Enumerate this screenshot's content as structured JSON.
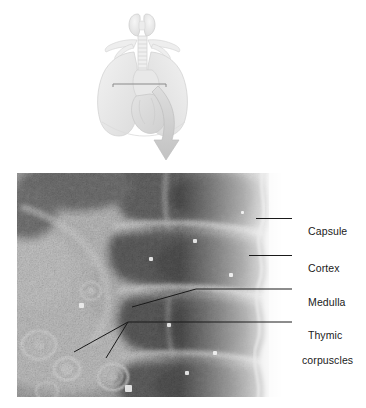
{
  "figure": {
    "illustration": {
      "name": "thorax-thymus-illustration",
      "description": "Anterior view of thorax showing thyroid gland, trachea, lungs and heart with a curved arrow pointing to the micrograph below",
      "structures": [
        "thyroid gland",
        "trachea",
        "right lung",
        "left lung",
        "heart",
        "clavicles"
      ],
      "indicator_line": "horizontal section indicator across the mediastinum",
      "arrow": "curved-down-arrow"
    },
    "micrograph": {
      "name": "thymus-light-micrograph",
      "description": "Light micrograph of thymus showing capsule, cortex, medulla and thymic corpuscles",
      "stain": "grayscale",
      "regions": [
        "capsule",
        "cortex",
        "medulla",
        "thymic corpuscles"
      ]
    },
    "labels": [
      {
        "id": "capsule",
        "text": "Capsule",
        "text2": ""
      },
      {
        "id": "cortex",
        "text": "Cortex",
        "text2": ""
      },
      {
        "id": "medulla",
        "text": "Medulla",
        "text2": ""
      },
      {
        "id": "thymic",
        "text": "Thymic",
        "text2": "corpuscles"
      }
    ],
    "colors": {
      "label_text": "#1a1a1a",
      "leader_line": "#1a1a1a",
      "background": "#ffffff",
      "micrograph_mid": "#8c8c8c",
      "micrograph_dark": "#4a4a4a",
      "micrograph_light": "#d8d8d8",
      "illustration_tint": "#e9e9e9"
    }
  }
}
